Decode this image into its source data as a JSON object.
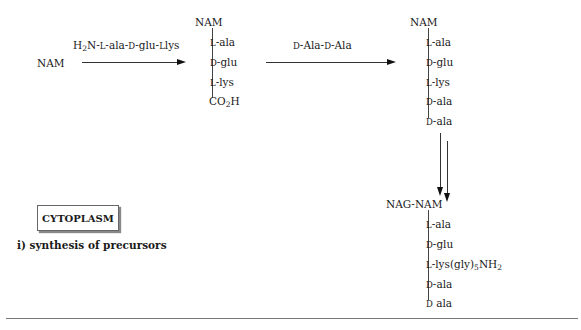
{
  "start": {
    "label": "NAM"
  },
  "step1": {
    "reagent": {
      "prefix1": "H",
      "sub1": "2",
      "rest": "N-",
      "l1": "L",
      "a1": "-ala-",
      "d1": "D",
      "a2": "-glu-",
      "l2": "L",
      "a3": "lys"
    },
    "product": {
      "head": "NAM",
      "residues": [
        {
          "stereo": "L",
          "name": "-ala"
        },
        {
          "stereo": "D",
          "name": "-glu"
        },
        {
          "stereo": "L",
          "name": "-lys"
        }
      ],
      "terminal": {
        "main": "CO",
        "sub": "2",
        "tail": "H"
      }
    }
  },
  "step2": {
    "reagent": {
      "d1": "D",
      "a1": "-Ala-",
      "d2": "D",
      "a2": "-Ala"
    },
    "product": {
      "head": "NAM",
      "residues": [
        {
          "stereo": "L",
          "name": "-ala"
        },
        {
          "stereo": "D",
          "name": "-glu"
        },
        {
          "stereo": "L",
          "name": "-lys"
        },
        {
          "stereo": "D",
          "name": "-ala"
        },
        {
          "stereo": "D",
          "name": "-ala"
        }
      ]
    }
  },
  "step3": {
    "product": {
      "head": "NAG-NAM",
      "residues": [
        {
          "stereo": "L",
          "name": "-ala"
        },
        {
          "stereo": "D",
          "name": "-glu"
        },
        {
          "stereo": "L",
          "name": "-lys(gly)",
          "sub": "5",
          "tail": "NH",
          "sub2": "2"
        },
        {
          "stereo": "D",
          "name": "-ala"
        },
        {
          "stereo": "D",
          "name": " ala"
        }
      ]
    }
  },
  "compartment": {
    "label": "CYTOPLASM"
  },
  "caption": "i) synthesis of precursors"
}
